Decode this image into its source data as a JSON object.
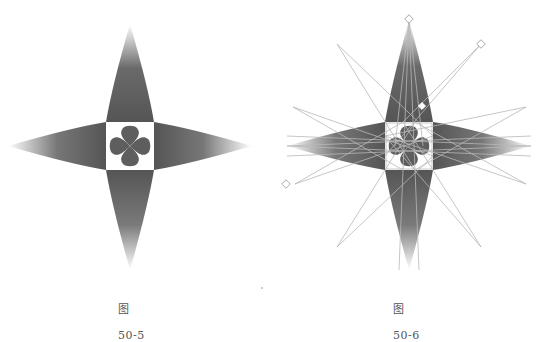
{
  "figures": [
    {
      "id": "fig-50-5",
      "caption_prefix": "图",
      "caption_number": "50-5",
      "description": "Four-pointed star with gradient spikes and a four-petal clover in a center square"
    },
    {
      "id": "fig-50-6",
      "caption_prefix": "图",
      "caption_number": "50-6",
      "description": "Same star shown with selection outline and eight thin construction spikes with diamond handles"
    }
  ],
  "colors": {
    "spike_dark": "#5a5a5a",
    "spike_light": "#ffffff",
    "petal": "#5e5e5e",
    "outline": "#b8b8b8",
    "caption": "#555555"
  }
}
